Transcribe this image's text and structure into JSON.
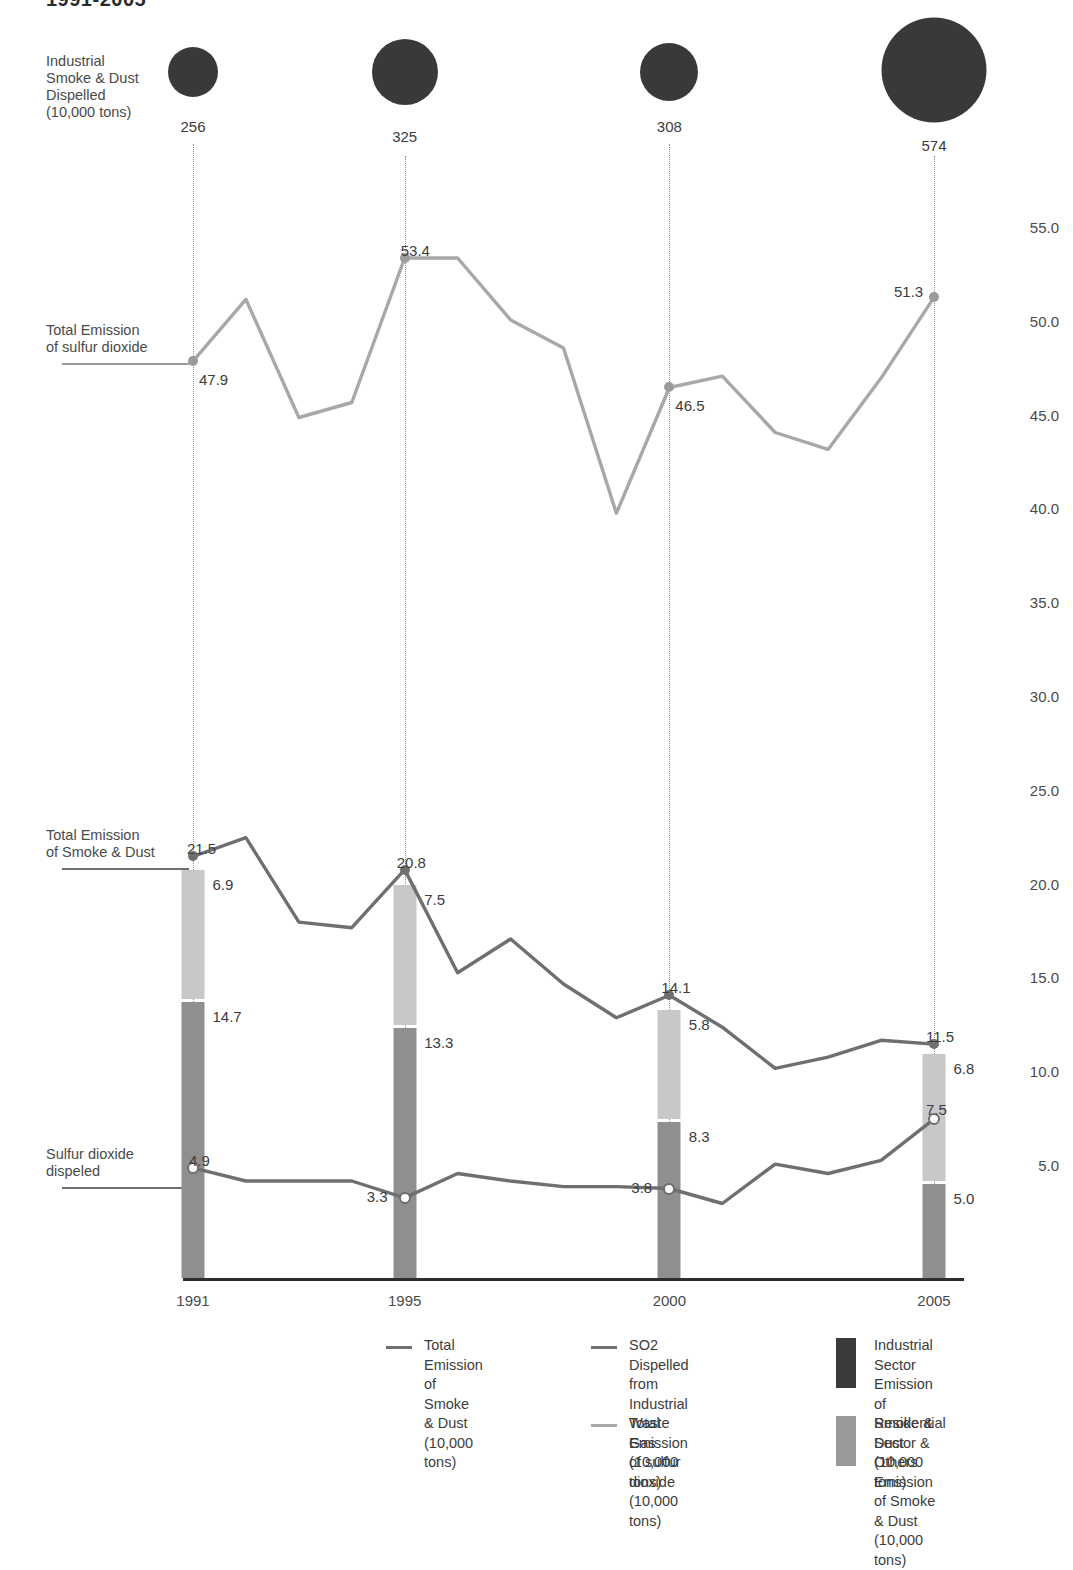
{
  "header": {
    "title": "1991-2005"
  },
  "left_labels": {
    "bubble_row": "Industrial\nSmoke & Dust\nDispelled\n(10,000 tons)",
    "so2_total": "Total Emission\nof sulfur dioxide",
    "dust_total": "Total Emission\nof Smoke & Dust",
    "so2_dispelled": "Sulfur dioxide\ndispeled"
  },
  "axis": {
    "y_ticks": [
      "55.0",
      "50.0",
      "45.0",
      "40.0",
      "35.0",
      "30.0",
      "25.0",
      "20.0",
      "15.0",
      "10.0",
      "5.0"
    ],
    "x_ticks": [
      "1991",
      "1995",
      "2000",
      "2005"
    ]
  },
  "colors": {
    "industrial_sector": "#8f8f8f",
    "residential_sector": "#c8c8c8",
    "legend_industrial": "#3a3a3a",
    "legend_residential": "#9a9a9a",
    "dust_line": "#6f6f6f",
    "so2_line": "#a8a8a8",
    "so2_dispelled_line": "#6f6f6f",
    "bubble": "#393939"
  },
  "legend": {
    "items": [
      {
        "name": "total-emission-smoke-dust",
        "marker": "line-dark",
        "text": "Total Emission\nof Smoke & Dust\n(10,000 tons)"
      },
      {
        "name": "so2-dispelled-industrial-waste-gas",
        "marker": "line-dark",
        "text": "SO2  Dispelled from\nIndustrial Waste Gas\n(10,000 tons)"
      },
      {
        "name": "total-emission-sulfur-dioxide",
        "marker": "line-light",
        "text": "Total Emission\nof sulfur dioxide\n(10,000 tons)"
      },
      {
        "name": "industrial-sector-emission",
        "marker": "box-dark",
        "text": "Industrial Sector Emission\nof Smoke & Dust\n(10,000 tons)"
      },
      {
        "name": "residential-sector-emission",
        "marker": "box-light",
        "text": "Residential Sector & Others\nEmission of Smoke & Dust\n(10,000 tons)"
      }
    ]
  },
  "chart_data": {
    "type": "line",
    "title": "1991-2005",
    "xlabel": "",
    "ylabel": "(10,000 tons)",
    "ylim": [
      0,
      57
    ],
    "grid": false,
    "legend_position": "bottom",
    "x": [
      1991,
      1992,
      1993,
      1994,
      1995,
      1996,
      1997,
      1998,
      1999,
      2000,
      2001,
      2002,
      2003,
      2004,
      2005
    ],
    "labeled_years": [
      1991,
      1995,
      2000,
      2005
    ],
    "series": [
      {
        "name": "Total Emission of sulfur dioxide (10,000 tons)",
        "style": "line-light",
        "values": [
          47.9,
          51.2,
          44.9,
          45.7,
          53.4,
          53.4,
          50.1,
          48.6,
          39.8,
          46.5,
          47.1,
          44.1,
          43.2,
          47.0,
          51.3
        ],
        "labeled_points": {
          "1991": "47.9",
          "1995": "53.4",
          "2000": "46.5",
          "2005": "51.3"
        }
      },
      {
        "name": "Total Emission of Smoke & Dust (10,000 tons)",
        "style": "line-dark",
        "values": [
          21.5,
          22.5,
          18.0,
          17.7,
          20.8,
          15.3,
          17.1,
          14.7,
          12.9,
          14.1,
          12.4,
          10.2,
          10.8,
          11.7,
          11.5
        ],
        "labeled_points": {
          "1991": "21.5",
          "1995": "20.8",
          "2000": "14.1",
          "2005": "11.5"
        }
      },
      {
        "name": "SO2 Dispelled from Industrial Waste Gas (10,000 tons)",
        "style": "line-dark-hollow",
        "values": [
          4.9,
          4.2,
          4.2,
          4.2,
          3.3,
          4.6,
          4.2,
          3.9,
          3.9,
          3.8,
          3.0,
          5.1,
          4.6,
          5.3,
          7.5
        ],
        "labeled_points": {
          "1991": "4.9",
          "1995": "3.3",
          "2000": "3.8",
          "2005": "7.5"
        }
      }
    ],
    "stacked_bars": {
      "categories": [
        "1991",
        "1995",
        "2000",
        "2005"
      ],
      "totals": [
        "21.5",
        "20.8",
        "14.1",
        "11.5"
      ],
      "segments": [
        {
          "name": "Residential Sector & Others Emission of Smoke & Dust",
          "values": [
            6.9,
            7.5,
            5.8,
            6.8
          ],
          "labels": [
            "6.9",
            "7.5",
            "5.8",
            "6.8"
          ]
        },
        {
          "name": "Industrial Sector Emission of Smoke & Dust",
          "values": [
            14.7,
            13.3,
            8.3,
            5.0
          ],
          "labels": [
            "14.7",
            "13.3",
            "8.3",
            "5.0"
          ]
        }
      ]
    },
    "bubbles": {
      "name": "Industrial Smoke & Dust Dispelled (10,000 tons)",
      "categories": [
        "1991",
        "1995",
        "2000",
        "2005"
      ],
      "values": [
        256,
        325,
        308,
        574
      ],
      "labels": [
        "256",
        "325",
        "308",
        "574"
      ]
    }
  }
}
